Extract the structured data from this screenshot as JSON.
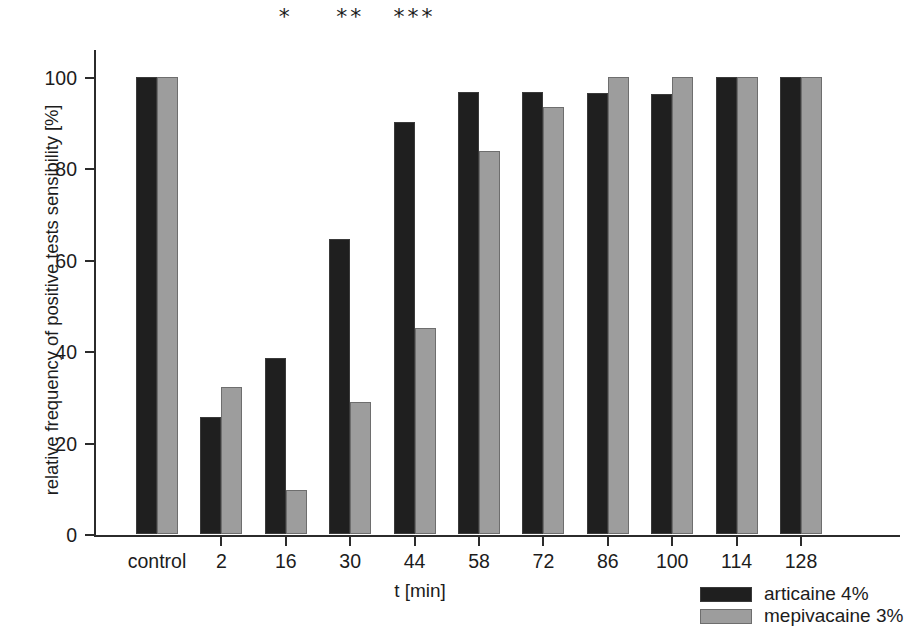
{
  "chart_data": {
    "type": "bar",
    "title": "",
    "xlabel": "t [min]",
    "ylabel": "relative frequency of positive tests sensibility [%]",
    "categories": [
      "control",
      "2",
      "16",
      "30",
      "44",
      "58",
      "72",
      "86",
      "100",
      "114",
      "128"
    ],
    "series": [
      {
        "name": "articaine 4%",
        "color": "#1f1f1f",
        "values": [
          100,
          25.5,
          38.5,
          64.5,
          90.2,
          96.7,
          96.7,
          96.4,
          96.3,
          100,
          100
        ]
      },
      {
        "name": "mepivacaine 3%",
        "color": "#9d9d9d",
        "values": [
          100,
          32.2,
          9.6,
          28.9,
          45.0,
          83.8,
          93.4,
          100,
          100,
          100,
          100
        ]
      }
    ],
    "ylim": [
      0,
      100
    ],
    "yticks": [
      0,
      20,
      40,
      60,
      80,
      100
    ],
    "ytick_labels": [
      "0",
      "20",
      "40",
      "60",
      "80",
      "100"
    ],
    "grid": false,
    "legend_position": "bottom-right",
    "annotations": [
      {
        "category": "16",
        "text": "*"
      },
      {
        "category": "30",
        "text": "**"
      },
      {
        "category": "44",
        "text": "***"
      }
    ]
  },
  "legend": {
    "entries": [
      {
        "label": "articaine 4%"
      },
      {
        "label": "mepivacaine 3%"
      }
    ]
  }
}
